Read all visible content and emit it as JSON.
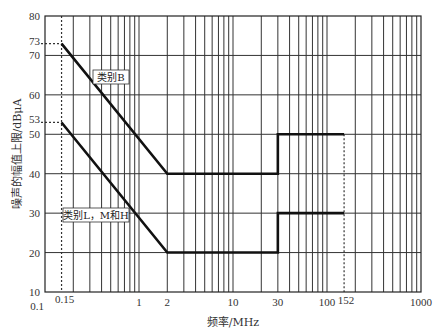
{
  "chart_data": {
    "type": "line",
    "title": "",
    "xlabel": "频率/MHz",
    "ylabel": "噪声的幅值上限/dBμA",
    "xscale": "log",
    "xlim": [
      0.1,
      1000
    ],
    "ylim": [
      10,
      80
    ],
    "grid": true,
    "x_tick_labels": [
      {
        "value": 0.1,
        "label": "0.1"
      },
      {
        "value": 0.15,
        "label": "0.15"
      },
      {
        "value": 1,
        "label": "1"
      },
      {
        "value": 2,
        "label": "2"
      },
      {
        "value": 10,
        "label": "10"
      },
      {
        "value": 30,
        "label": "30"
      },
      {
        "value": 100,
        "label": "100"
      },
      {
        "value": 152,
        "label": "152"
      },
      {
        "value": 1000,
        "label": "1000"
      }
    ],
    "y_ticks": [
      10,
      20,
      30,
      40,
      50,
      60,
      70,
      80
    ],
    "y_extra_ticks": [
      {
        "value": 73,
        "label": "73"
      },
      {
        "value": 53,
        "label": "53"
      }
    ],
    "reference_lines": [
      {
        "orientation": "vertical",
        "x": 0.15,
        "style": "dashed"
      },
      {
        "orientation": "vertical",
        "x": 152,
        "from_y": 50,
        "style": "dashed"
      },
      {
        "orientation": "horizontal",
        "y": 73,
        "to_x": 0.15,
        "style": "dashed"
      },
      {
        "orientation": "horizontal",
        "y": 53,
        "to_x": 0.15,
        "style": "dashed"
      }
    ],
    "series": [
      {
        "name": "类别B",
        "points": [
          [
            0.15,
            73
          ],
          [
            2,
            40
          ],
          [
            30,
            40
          ],
          [
            30,
            50
          ],
          [
            152,
            50
          ]
        ]
      },
      {
        "name": "类别L，M和H",
        "points": [
          [
            0.15,
            53
          ],
          [
            2,
            20
          ],
          [
            30,
            20
          ],
          [
            30,
            30
          ],
          [
            152,
            30
          ]
        ]
      }
    ],
    "annotations": [
      {
        "text": "类别B",
        "series": 0
      },
      {
        "text": "类别L，M和H",
        "series": 1
      }
    ]
  }
}
